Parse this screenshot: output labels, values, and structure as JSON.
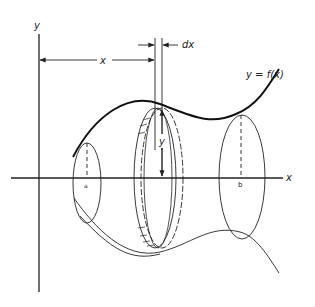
{
  "figure": {
    "labels": {
      "y_axis": "y",
      "x_axis": "x",
      "x_distance": "x",
      "dx": "dx",
      "y_radius": "y",
      "curve": "y = f(x)",
      "a": "a",
      "b": "b"
    },
    "colors": {
      "ink": "#222222",
      "background": "#ffffff"
    }
  }
}
